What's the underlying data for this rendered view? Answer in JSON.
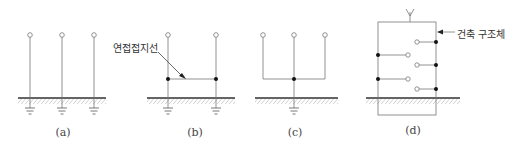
{
  "figure": {
    "panels": [
      {
        "id": "a",
        "label": "(a)",
        "description": "Independent grounding: three separate electrodes"
      },
      {
        "id": "b",
        "label": "(b)",
        "description": "Two electrodes joined by connecting ground wire"
      },
      {
        "id": "c",
        "label": "(c)",
        "description": "Common grounding: three terminals to one electrode"
      },
      {
        "id": "d",
        "label": "(d)",
        "description": "Structural grounding via building structure"
      }
    ],
    "annotations": {
      "connecting_ground_wire": "연접접지선",
      "building_structure": "건축 구조체"
    },
    "colors": {
      "line": "#555555",
      "ground": "#333333",
      "hatch": "#888888",
      "dot": "#111111"
    }
  }
}
